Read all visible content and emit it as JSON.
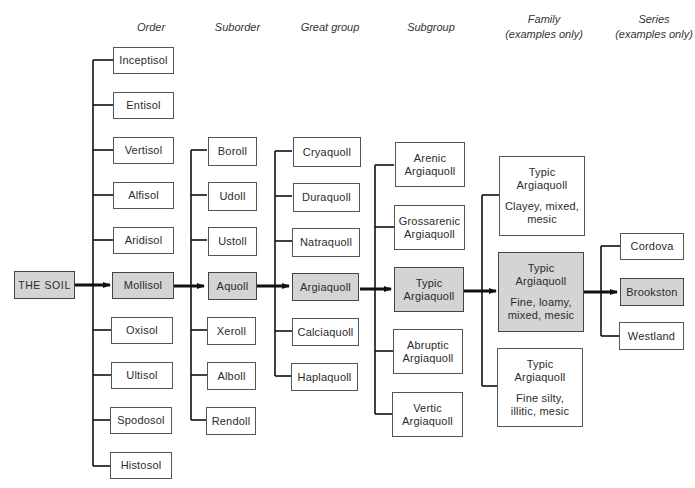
{
  "headers": {
    "order": "Order",
    "suborder": "Suborder",
    "great_group": "Great group",
    "subgroup": "Subgroup",
    "family_line1": "Family",
    "family_line2": "(examples only)",
    "series_line1": "Series",
    "series_line2": "(examples only)"
  },
  "root": {
    "label": "THE SOIL",
    "highlighted": true
  },
  "orders": [
    {
      "label": "Inceptisol"
    },
    {
      "label": "Entisol"
    },
    {
      "label": "Vertisol"
    },
    {
      "label": "Alfisol"
    },
    {
      "label": "Aridisol"
    },
    {
      "label": "Mollisol",
      "highlighted": true
    },
    {
      "label": "Oxisol"
    },
    {
      "label": "Ultisol"
    },
    {
      "label": "Spodosol"
    },
    {
      "label": "Histosol"
    }
  ],
  "suborders": [
    {
      "label": "Boroll"
    },
    {
      "label": "Udoll"
    },
    {
      "label": "Ustoll"
    },
    {
      "label": "Aquoll",
      "highlighted": true
    },
    {
      "label": "Xeroll"
    },
    {
      "label": "Alboll"
    },
    {
      "label": "Rendoll"
    }
  ],
  "great_groups": [
    {
      "label": "Cryaquoll"
    },
    {
      "label": "Duraquoll"
    },
    {
      "label": "Natraquoll"
    },
    {
      "label": "Argiaquoll",
      "highlighted": true
    },
    {
      "label": "Calciaquoll"
    },
    {
      "label": "Haplaquoll"
    }
  ],
  "subgroups": [
    {
      "line1": "Arenic",
      "line2": "Argiaquoll"
    },
    {
      "line1": "Grossarenic",
      "line2": "Argiaquoll"
    },
    {
      "line1": "Typic",
      "line2": "Argiaquoll",
      "highlighted": true
    },
    {
      "line1": "Abruptic",
      "line2": "Argiaquoll"
    },
    {
      "line1": "Vertic",
      "line2": "Argiaquoll"
    }
  ],
  "families": [
    {
      "line1": "Typic",
      "line2": "Argiaquoll",
      "line3": "Clayey, mixed,",
      "line4": "mesic"
    },
    {
      "line1": "Typic",
      "line2": "Argiaquoll",
      "line3": "Fine, loamy,",
      "line4": "mixed, mesic",
      "highlighted": true
    },
    {
      "line1": "Typic",
      "line2": "Argiaquoll",
      "line3": "Fine silty,",
      "line4": "illitic, mesic"
    }
  ],
  "series": [
    {
      "label": "Cordova"
    },
    {
      "label": "Brookston",
      "highlighted": true
    },
    {
      "label": "Westland"
    }
  ],
  "colors": {
    "highlight_fill": "#d4d4d4",
    "line": "#111111",
    "box_border": "#555555"
  }
}
